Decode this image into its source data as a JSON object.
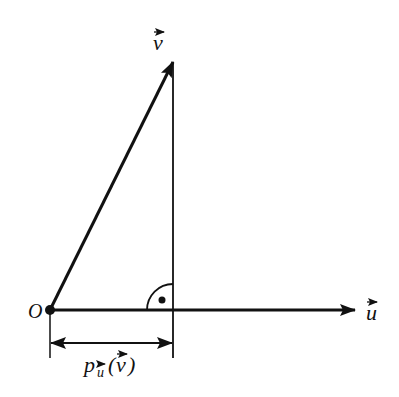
{
  "diagram": {
    "labels": {
      "origin": "O",
      "vector_v": "v",
      "vector_u": "u",
      "projection_p": "p",
      "projection_sub": "u",
      "projection_open": "(",
      "projection_arg": "v",
      "projection_close": ")"
    },
    "points": {
      "origin": [
        50,
        310
      ],
      "v_tip": [
        173,
        62
      ],
      "u_tip": [
        356,
        310
      ],
      "foot": [
        173,
        310
      ]
    },
    "colors": {
      "stroke": "#111111",
      "background": "#ffffff"
    }
  }
}
